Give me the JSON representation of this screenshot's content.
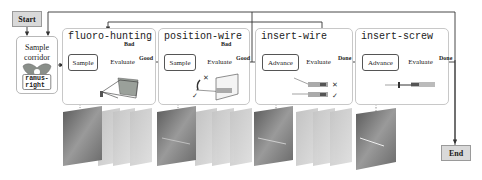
{
  "start": {
    "label": "Start"
  },
  "end": {
    "label": "End"
  },
  "corridor": {
    "title_line1": "Sample",
    "title_line2": "corridor",
    "tag": "ramus-right",
    "icon": "pelvis-icon"
  },
  "stages": [
    {
      "title": "fluoro-hunting",
      "process": "Sample",
      "decision": "Evaluate",
      "loop_label": "Bad",
      "exit_label": "Good",
      "illustration": "camera-frustum-pelvis-icon"
    },
    {
      "title": "position-wire",
      "process": "Sample",
      "decision": "Evaluate",
      "loop_label": "Bad",
      "exit_label": "Good",
      "illustration": "wire-orientation-plane-icon"
    },
    {
      "title": "insert-wire",
      "process": "Advance",
      "decision": "Evaluate",
      "exit_label": "Done",
      "illustration": "wire-insertion-check-icon",
      "marks": [
        "✕",
        "✓"
      ]
    },
    {
      "title": "insert-screw",
      "process": "Advance",
      "decision": "Evaluate",
      "exit_label": "Done",
      "illustration": "screw-insertion-icon"
    }
  ],
  "image_stacks": [
    {
      "stage": "fluoro-hunting",
      "count": 4
    },
    {
      "stage": "position-wire",
      "count": 4
    },
    {
      "stage": "insert-wire",
      "count": 4
    },
    {
      "stage": "insert-screw",
      "count": 1
    }
  ],
  "colors": {
    "terminal_fill": "#d9d9d9",
    "stage_border": "#c8c8c8",
    "line": "#333333"
  }
}
